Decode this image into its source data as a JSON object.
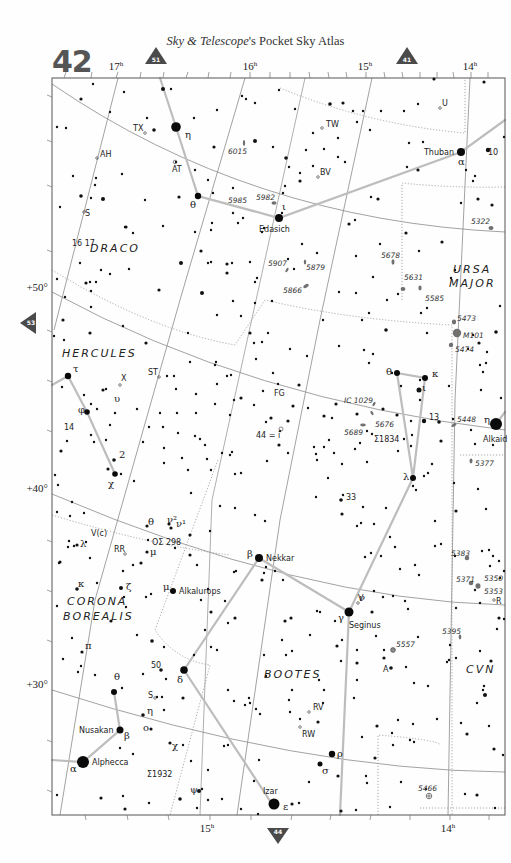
{
  "header": {
    "page_number": "42",
    "title_italic": "Sky & Telescope",
    "title_rest": "'s Pocket Sky Atlas"
  },
  "nav_markers": [
    {
      "id": "51",
      "direction": "up",
      "x": 156,
      "y": 58
    },
    {
      "id": "41",
      "direction": "up",
      "x": 407,
      "y": 58
    },
    {
      "id": "53",
      "direction": "left",
      "x": 30,
      "y": 323
    },
    {
      "id": "44",
      "direction": "down",
      "x": 278,
      "y": 835
    }
  ],
  "frame": {
    "x": 52,
    "y": 78,
    "width": 453,
    "height": 737
  },
  "ra_labels_top": [
    {
      "text": "17",
      "sup": "h",
      "x": 116
    },
    {
      "text": "16",
      "sup": "h",
      "x": 250
    },
    {
      "text": "15",
      "sup": "h",
      "x": 365
    },
    {
      "text": "14",
      "sup": "h",
      "x": 470
    }
  ],
  "ra_labels_bottom": [
    {
      "text": "15",
      "sup": "h",
      "x": 207
    },
    {
      "text": "14",
      "sup": "h",
      "x": 448
    }
  ],
  "dec_labels": [
    {
      "text": "+50°",
      "y": 291
    },
    {
      "text": "+40°",
      "y": 492
    },
    {
      "text": "+30°",
      "y": 688
    }
  ],
  "constellations": [
    {
      "name": "DRACO",
      "x": 90,
      "y": 252
    },
    {
      "name": "HERCULES",
      "x": 62,
      "y": 357
    },
    {
      "name": "URSA",
      "x": 453,
      "y": 273
    },
    {
      "name": "MAJOR",
      "x": 449,
      "y": 287
    },
    {
      "name": "CORONA",
      "x": 67,
      "y": 605
    },
    {
      "name": "BOREALIS",
      "x": 63,
      "y": 620
    },
    {
      "name": "BOOTES",
      "x": 264,
      "y": 678
    },
    {
      "name": "CVN",
      "x": 466,
      "y": 673
    }
  ],
  "named_stars": [
    {
      "name": "Thuban",
      "greek": "α",
      "x": 461,
      "y": 152,
      "r": 4
    },
    {
      "name": "Edasich",
      "greek": "ι",
      "x": 279,
      "y": 218,
      "r": 4
    },
    {
      "name": "Alkaid",
      "greek": "η",
      "x": 496,
      "y": 424,
      "r": 6
    },
    {
      "name": "Nekkar",
      "greek": "β",
      "x": 259,
      "y": 558,
      "r": 4
    },
    {
      "name": "Seginus",
      "greek": "γ",
      "x": 349,
      "y": 612,
      "r": 4.5
    },
    {
      "name": "Alkalurops",
      "greek": "μ",
      "x": 173,
      "y": 591,
      "r": 3
    },
    {
      "name": "Nusakan",
      "greek": "β",
      "x": 120,
      "y": 730,
      "r": 3.5
    },
    {
      "name": "Alphecca",
      "greek": "α",
      "x": 83,
      "y": 762,
      "r": 6
    },
    {
      "name": "Izar",
      "greek": "ε",
      "x": 274,
      "y": 804,
      "r": 5.5
    }
  ],
  "greek_labels": [
    {
      "text": "η",
      "x": 185,
      "y": 138
    },
    {
      "text": "θ",
      "x": 190,
      "y": 208
    },
    {
      "text": "θ",
      "x": 386,
      "y": 375
    },
    {
      "text": "κ",
      "x": 432,
      "y": 377
    },
    {
      "text": "ι",
      "x": 422,
      "y": 391
    },
    {
      "text": "λ",
      "x": 403,
      "y": 480
    },
    {
      "text": "τ",
      "x": 73,
      "y": 372
    },
    {
      "text": "υ",
      "x": 114,
      "y": 402
    },
    {
      "text": "φ",
      "x": 78,
      "y": 413
    },
    {
      "text": "χ",
      "x": 108,
      "y": 487
    },
    {
      "text": "2",
      "x": 119,
      "y": 458
    },
    {
      "text": "λ",
      "x": 80,
      "y": 547
    },
    {
      "text": "θ",
      "x": 148,
      "y": 525
    },
    {
      "text": "ν²",
      "x": 167,
      "y": 523
    },
    {
      "text": "ν¹",
      "x": 176,
      "y": 527
    },
    {
      "text": "μ",
      "x": 150,
      "y": 555
    },
    {
      "text": "κ",
      "x": 78,
      "y": 587
    },
    {
      "text": "ζ",
      "x": 126,
      "y": 590
    },
    {
      "text": "π",
      "x": 85,
      "y": 649
    },
    {
      "text": "μ",
      "x": 163,
      "y": 590
    },
    {
      "text": "δ",
      "x": 177,
      "y": 683
    },
    {
      "text": "θ",
      "x": 114,
      "y": 680
    },
    {
      "text": "η",
      "x": 147,
      "y": 714
    },
    {
      "text": "ο",
      "x": 143,
      "y": 731
    },
    {
      "text": "χ",
      "x": 172,
      "y": 749
    },
    {
      "text": "ψ",
      "x": 190,
      "y": 793
    },
    {
      "text": "ρ",
      "x": 337,
      "y": 757
    },
    {
      "text": "σ",
      "x": 322,
      "y": 774
    },
    {
      "text": "ν",
      "x": 359,
      "y": 601
    },
    {
      "text": "β",
      "x": 247,
      "y": 557
    },
    {
      "text": "γ",
      "x": 338,
      "y": 621
    },
    {
      "text": "α",
      "x": 70,
      "y": 772
    },
    {
      "text": "β",
      "x": 124,
      "y": 739
    },
    {
      "text": "ι",
      "x": 282,
      "y": 210
    },
    {
      "text": "α",
      "x": 458,
      "y": 165
    },
    {
      "text": "η",
      "x": 484,
      "y": 423
    },
    {
      "text": "ε",
      "x": 283,
      "y": 810
    }
  ],
  "catalog_labels": [
    {
      "text": "6015",
      "x": 228,
      "y": 154,
      "type": "galaxy"
    },
    {
      "text": "5985",
      "x": 228,
      "y": 203,
      "type": "galaxy"
    },
    {
      "text": "5982",
      "x": 256,
      "y": 200,
      "type": "galaxy"
    },
    {
      "text": "5322",
      "x": 471,
      "y": 224,
      "type": "galaxy"
    },
    {
      "text": "5907",
      "x": 268,
      "y": 266,
      "type": "galaxy"
    },
    {
      "text": "5879",
      "x": 306,
      "y": 270,
      "type": "galaxy"
    },
    {
      "text": "5678",
      "x": 381,
      "y": 258,
      "type": "galaxy"
    },
    {
      "text": "5866",
      "x": 283,
      "y": 293,
      "type": "galaxy"
    },
    {
      "text": "5631",
      "x": 404,
      "y": 280,
      "type": "galaxy"
    },
    {
      "text": "5585",
      "x": 425,
      "y": 301,
      "type": "galaxy"
    },
    {
      "text": "5473",
      "x": 457,
      "y": 321,
      "type": "galaxy"
    },
    {
      "text": "M101",
      "x": 463,
      "y": 338,
      "type": "galaxy"
    },
    {
      "text": "5474",
      "x": 455,
      "y": 352,
      "type": "galaxy"
    },
    {
      "text": "IC 1029",
      "x": 344,
      "y": 403,
      "type": "galaxy"
    },
    {
      "text": "5676",
      "x": 375,
      "y": 427,
      "type": "galaxy"
    },
    {
      "text": "5689",
      "x": 344,
      "y": 435,
      "type": "galaxy"
    },
    {
      "text": "5448",
      "x": 457,
      "y": 422,
      "type": "galaxy"
    },
    {
      "text": "5377",
      "x": 475,
      "y": 466,
      "type": "galaxy"
    },
    {
      "text": "5383",
      "x": 451,
      "y": 556,
      "type": "galaxy"
    },
    {
      "text": "5371",
      "x": 456,
      "y": 582,
      "type": "galaxy"
    },
    {
      "text": "5350",
      "x": 484,
      "y": 581,
      "type": "galaxy"
    },
    {
      "text": "5353",
      "x": 484,
      "y": 594,
      "type": "galaxy"
    },
    {
      "text": "5395",
      "x": 442,
      "y": 634,
      "type": "galaxy"
    },
    {
      "text": "5557",
      "x": 396,
      "y": 647,
      "type": "globular"
    },
    {
      "text": "5466",
      "x": 418,
      "y": 791,
      "type": "globular"
    }
  ],
  "misc_labels": [
    {
      "text": "TW",
      "x": 326,
      "y": 127
    },
    {
      "text": "TX",
      "x": 133,
      "y": 131
    },
    {
      "text": "U",
      "x": 442,
      "y": 106
    },
    {
      "text": "10",
      "x": 488,
      "y": 155
    },
    {
      "text": "AH",
      "x": 100,
      "y": 157
    },
    {
      "text": "AT",
      "x": 172,
      "y": 172
    },
    {
      "text": "BV",
      "x": 320,
      "y": 175
    },
    {
      "text": "S",
      "x": 85,
      "y": 216
    },
    {
      "text": "16 17",
      "x": 72,
      "y": 246
    },
    {
      "text": "ST",
      "x": 148,
      "y": 375
    },
    {
      "text": "X",
      "x": 121,
      "y": 381
    },
    {
      "text": "FG",
      "x": 274,
      "y": 396
    },
    {
      "text": "44 = i",
      "x": 256,
      "y": 438
    },
    {
      "text": "Σ1834",
      "x": 374,
      "y": 442
    },
    {
      "text": "13",
      "x": 429,
      "y": 420
    },
    {
      "text": "14",
      "x": 64,
      "y": 430
    },
    {
      "text": "33",
      "x": 346,
      "y": 500
    },
    {
      "text": "V(c)",
      "x": 91,
      "y": 536
    },
    {
      "text": "RR",
      "x": 114,
      "y": 552
    },
    {
      "text": "OΣ 298",
      "x": 152,
      "y": 545
    },
    {
      "text": "V",
      "x": 358,
      "y": 601
    },
    {
      "text": "R",
      "x": 496,
      "y": 604
    },
    {
      "text": "A",
      "x": 383,
      "y": 672
    },
    {
      "text": "50",
      "x": 151,
      "y": 668
    },
    {
      "text": "S",
      "x": 148,
      "y": 698
    },
    {
      "text": "RV",
      "x": 313,
      "y": 710
    },
    {
      "text": "RW",
      "x": 302,
      "y": 737
    },
    {
      "text": "Σ1932",
      "x": 147,
      "y": 777
    }
  ],
  "colors": {
    "ink": "#111111",
    "grid": "#8a8a8a",
    "stick": "#b8b8b8",
    "boundary": "#a0a0a0",
    "galaxy": "#707070",
    "marker": "#4a4a4a",
    "page_number": "#555555"
  }
}
